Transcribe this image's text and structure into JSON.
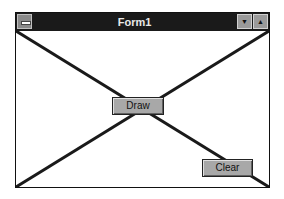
{
  "window": {
    "title": "Form1",
    "system_menu_icon": "system-menu-icon",
    "minimize_icon": "▼",
    "maximize_icon": "▲"
  },
  "buttons": {
    "draw_label": "Draw",
    "clear_label": "Clear"
  },
  "canvas": {
    "lines": [
      {
        "x1": 0,
        "y1": 0,
        "x2": 253,
        "y2": 156
      },
      {
        "x1": 253,
        "y1": 0,
        "x2": 0,
        "y2": 156
      }
    ],
    "line_color": "#1a1a1a"
  }
}
